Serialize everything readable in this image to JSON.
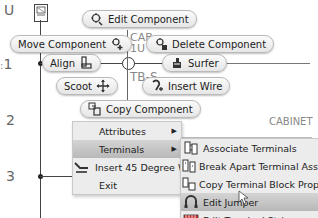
{
  "drawing": {
    "rungs": [
      "U",
      "1",
      "2",
      "3"
    ],
    "labels": {
      "cab": "CAB",
      "one_u": "1U",
      "tb_s": "TB-S",
      "cabinet": "CABINET",
      "tb_c": "TB–C"
    }
  },
  "marking_menu": {
    "edit_component": "Edit Component",
    "move_component": "Move Component",
    "delete_component": "Delete Component",
    "align": "Align",
    "surfer": "Surfer",
    "scoot": "Scoot",
    "insert_wire": "Insert Wire",
    "copy_component": "Copy Component"
  },
  "context_menu": {
    "items": [
      {
        "label": "Attributes",
        "submenu": true
      },
      {
        "label": "Terminals",
        "submenu": true
      },
      {
        "label": "Insert 45 Degree Wire",
        "submenu": false
      },
      {
        "label": "Exit",
        "submenu": false
      }
    ]
  },
  "submenu": {
    "items": [
      {
        "label": "Associate Terminals"
      },
      {
        "label": "Break Apart Terminal Associa"
      },
      {
        "label": "Copy Terminal Block Properti"
      },
      {
        "label": "Edit Jumper"
      },
      {
        "label": "Edit Terminal Strip"
      }
    ]
  }
}
